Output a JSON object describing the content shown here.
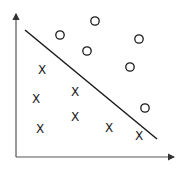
{
  "diagram": {
    "colors": {
      "ink": "#1a1a1a",
      "axis": "#555555",
      "background": "#ffffff"
    },
    "axes": {
      "origin": [
        16,
        157
      ],
      "y_top": [
        16,
        14
      ],
      "x_right": [
        174,
        157
      ]
    },
    "decision_boundary": {
      "from": [
        25,
        30
      ],
      "to": [
        157,
        139
      ]
    },
    "class_circle": {
      "symbol": "O",
      "points": [
        [
          60,
          35
        ],
        [
          95,
          21
        ],
        [
          87,
          51
        ],
        [
          139,
          39
        ],
        [
          130,
          67
        ],
        [
          145,
          108
        ]
      ]
    },
    "class_cross": {
      "symbol": "X",
      "points": [
        [
          42,
          70
        ],
        [
          36,
          99
        ],
        [
          75,
          92
        ],
        [
          75,
          117
        ],
        [
          40,
          129
        ],
        [
          109,
          128
        ],
        [
          139,
          136
        ]
      ]
    }
  },
  "chart_data": {
    "type": "scatter",
    "title": "",
    "xlabel": "",
    "ylabel": "",
    "grid": false,
    "legend": null,
    "series": [
      {
        "name": "circles (O)",
        "marker": "o",
        "points_px": [
          [
            60,
            35
          ],
          [
            95,
            21
          ],
          [
            87,
            51
          ],
          [
            139,
            39
          ],
          [
            130,
            67
          ],
          [
            145,
            108
          ]
        ]
      },
      {
        "name": "crosses (X)",
        "marker": "x",
        "points_px": [
          [
            42,
            70
          ],
          [
            36,
            99
          ],
          [
            75,
            92
          ],
          [
            75,
            117
          ],
          [
            40,
            129
          ],
          [
            109,
            128
          ],
          [
            139,
            136
          ]
        ]
      }
    ],
    "separator_line_px": [
      [
        25,
        30
      ],
      [
        157,
        139
      ]
    ]
  }
}
